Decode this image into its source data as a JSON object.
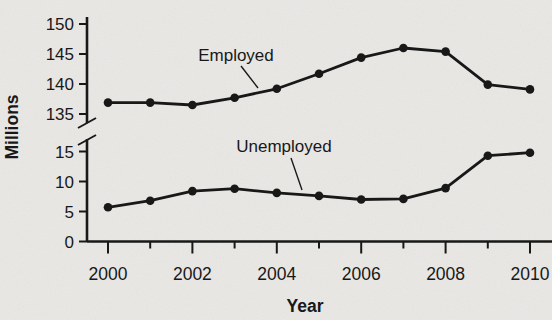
{
  "figure": {
    "background_color": "#e9e8e5",
    "ink_color": "#181818"
  },
  "chart_data": {
    "type": "line",
    "title": "",
    "xlabel": "Year",
    "ylabel": "Millions",
    "x": [
      2000,
      2001,
      2002,
      2003,
      2004,
      2005,
      2006,
      2007,
      2008,
      2009,
      2010
    ],
    "x_labeled_ticks": [
      2000,
      2002,
      2004,
      2006,
      2008,
      2010
    ],
    "series": [
      {
        "name": "Employed",
        "axis_section": "upper",
        "values": [
          136.9,
          136.9,
          136.5,
          137.7,
          139.2,
          141.7,
          144.4,
          146.0,
          145.4,
          139.9,
          139.1
        ]
      },
      {
        "name": "Unemployed",
        "axis_section": "lower",
        "values": [
          5.7,
          6.8,
          8.4,
          8.8,
          8.1,
          7.6,
          7.0,
          7.1,
          8.9,
          14.3,
          14.8
        ]
      }
    ],
    "y_axis": {
      "broken": true,
      "upper_ticks": [
        150,
        145,
        140,
        135
      ],
      "lower_ticks": [
        15,
        10,
        5,
        0
      ],
      "upper_range": [
        135,
        150
      ],
      "lower_range": [
        0,
        15
      ]
    },
    "annotations": [
      {
        "text": "Employed",
        "series": "Employed"
      },
      {
        "text": "Unemployed",
        "series": "Unemployed"
      }
    ],
    "legend": "none",
    "grid": false
  }
}
